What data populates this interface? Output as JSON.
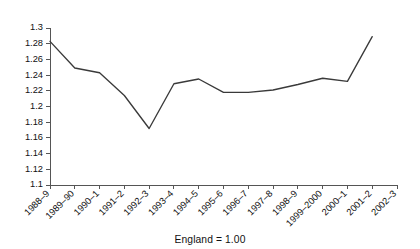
{
  "chart_data": {
    "type": "line",
    "title": "",
    "subtitle": "",
    "xlabel": "",
    "ylabel": "",
    "caption": "England = 1.00",
    "grid": false,
    "legend": "none",
    "categories": [
      "1988–9",
      "1989–90",
      "1990–1",
      "1991–2",
      "1992–3",
      "1993–4",
      "1994–5",
      "1995–6",
      "1996–7",
      "1997–8",
      "1998–9",
      "1999–2000",
      "2000–1",
      "2001–2",
      "2002–3"
    ],
    "values": [
      1.283,
      1.249,
      1.243,
      1.214,
      1.172,
      1.229,
      1.235,
      1.218,
      1.218,
      1.221,
      1.228,
      1.236,
      1.232,
      1.289,
      null
    ],
    "ylim": [
      1.1,
      1.3
    ],
    "ytick_step": 0.02,
    "ytick_labels": [
      "1.3",
      "1.28",
      "1.26",
      "1.24",
      "1.22",
      "1.2",
      "1.18",
      "1.16",
      "1.14",
      "1.12",
      "1.1"
    ],
    "ytick_values": [
      1.3,
      1.28,
      1.26,
      1.24,
      1.22,
      1.2,
      1.18,
      1.16,
      1.14,
      1.12,
      1.1
    ],
    "series_color": "#3a3a3a",
    "axis_color": "#555555",
    "xlabel_rotation_deg": -45
  }
}
